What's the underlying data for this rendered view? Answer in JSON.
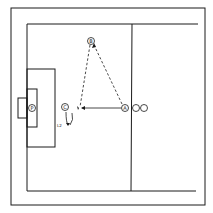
{
  "diagram": {
    "type": "soccer-drill",
    "colors": {
      "line": "#1a1a1a",
      "background": "#ffffff"
    },
    "players": [
      {
        "id": "goalkeeper",
        "label": "P",
        "x": 32,
        "y": 108
      },
      {
        "id": "player-a",
        "label": "A",
        "x": 125,
        "y": 108
      },
      {
        "id": "player-b",
        "label": "B",
        "x": 91,
        "y": 41
      },
      {
        "id": "player-c",
        "label": "C",
        "x": 65,
        "y": 107
      }
    ],
    "queue_cones": [
      {
        "x": 136,
        "y": 108
      },
      {
        "x": 144,
        "y": 108
      }
    ],
    "annotations": {
      "shot_label": "L2"
    },
    "movements": [
      {
        "from": "A",
        "to": "B",
        "style": "dashed",
        "meaning": "pass"
      },
      {
        "from": "B",
        "to": "point-near-C",
        "style": "dashed",
        "meaning": "pass"
      },
      {
        "from": "A",
        "to": "point-near-C",
        "style": "solid",
        "meaning": "run"
      },
      {
        "from": "C",
        "to": "shot-point",
        "style": "solid-curved",
        "meaning": "move"
      }
    ]
  }
}
